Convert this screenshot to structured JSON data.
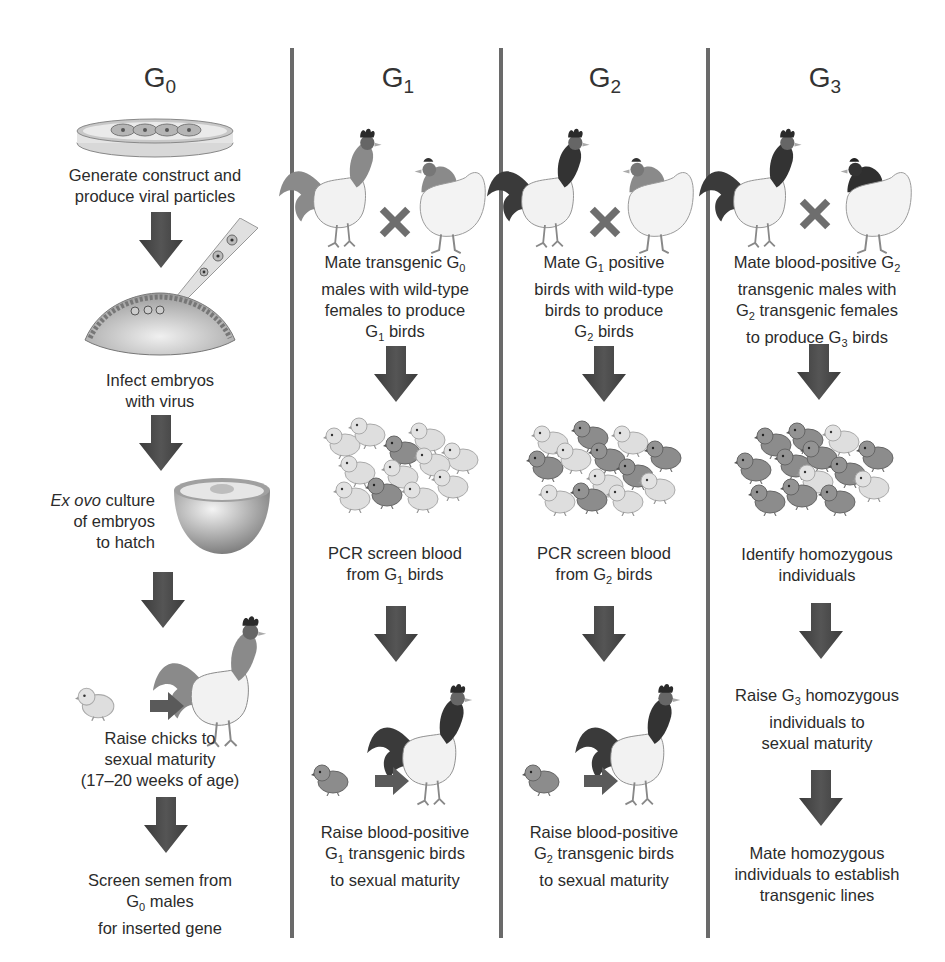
{
  "diagram": {
    "columns": [
      {
        "id": "g0",
        "title_base": "G",
        "title_sub": "0",
        "steps": {
          "s1": "Generate construct and",
          "s1b": "produce viral particles",
          "s2a": "Infect embryos",
          "s2b": "with virus",
          "s3_italic": "Ex ovo",
          "s3a": " culture",
          "s3b": "of embryos",
          "s3c": "to hatch",
          "s4a": "Raise chicks to",
          "s4b": "sexual maturity",
          "s4c": "(17–20 weeks of age)",
          "s5a": "Screen semen from",
          "s5b_base": "G",
          "s5b_sub": "0",
          "s5b_rest": " males",
          "s5c": "for inserted gene"
        },
        "illustrations": [
          "petri-dish",
          "embryo-injection",
          "ex-ovo-bowl",
          "chick-to-rooster"
        ]
      },
      {
        "id": "g1",
        "title_base": "G",
        "title_sub": "1",
        "steps": {
          "m1_pre": "Mate transgenic G",
          "m1_sub": "0",
          "m2": "males with wild-type",
          "m3": "females to produce",
          "m4_base": "G",
          "m4_sub": "1",
          "m4_rest": " birds",
          "p1": "PCR screen blood",
          "p2_pre": "from G",
          "p2_sub": "1",
          "p2_rest": " birds",
          "r1": "Raise blood-positive",
          "r2_base": "G",
          "r2_sub": "1",
          "r2_rest": " transgenic birds",
          "r3": "to sexual maturity"
        },
        "illustrations": [
          "rooster-hen-cross",
          "chick-group-mostly-light",
          "chick-to-rooster"
        ]
      },
      {
        "id": "g2",
        "title_base": "G",
        "title_sub": "2",
        "steps": {
          "m1_pre": "Mate G",
          "m1_sub": "1",
          "m1_rest": " positive",
          "m2": "birds with wild-type",
          "m3": "birds to produce",
          "m4_base": "G",
          "m4_sub": "2",
          "m4_rest": " birds",
          "p1": "PCR screen blood",
          "p2_pre": "from G",
          "p2_sub": "2",
          "p2_rest": " birds",
          "r1": "Raise blood-positive",
          "r2_base": "G",
          "r2_sub": "2",
          "r2_rest": " transgenic birds",
          "r3": "to sexual maturity"
        },
        "illustrations": [
          "rooster-hen-cross",
          "chick-group-mixed",
          "chick-to-rooster"
        ]
      },
      {
        "id": "g3",
        "title_base": "G",
        "title_sub": "3",
        "steps": {
          "m1_pre": "Mate blood-positive G",
          "m1_sub": "2",
          "m2": "transgenic males with",
          "m3_base": "G",
          "m3_sub": "2",
          "m3_rest": " transgenic females",
          "m4_pre": "to produce G",
          "m4_sub": "3",
          "m4_rest": " birds",
          "i1": "Identify homozygous",
          "i2": "individuals",
          "r1_pre": "Raise G",
          "r1_sub": "3",
          "r1_rest": " homozygous",
          "r2": "individuals to",
          "r3": "sexual maturity",
          "e1": "Mate homozygous",
          "e2": "individuals to establish",
          "e3": "transgenic lines"
        },
        "illustrations": [
          "rooster-hen-cross",
          "chick-group-mostly-dark"
        ]
      }
    ],
    "colors": {
      "arrow": "#4a4a4a",
      "cross": "#6e6e6e",
      "divider": "#6a6a6a",
      "text": "#2b2b2b",
      "chick_light": "#dcdcdc",
      "chick_dark": "#8a8a8a"
    }
  }
}
